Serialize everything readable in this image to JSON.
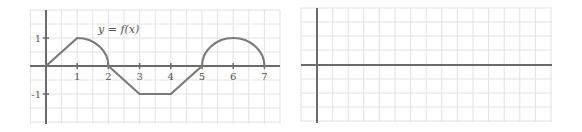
{
  "left_graph": {
    "label": "y = f(x)",
    "x_ticks": [
      "1",
      "2",
      "3",
      "4",
      "5",
      "6",
      "7"
    ],
    "y_ticks": [
      "1",
      "-1"
    ],
    "colors": {
      "axis": "#6b6b6b",
      "curve": "#7a7a7a",
      "grid": "#e2e2e2"
    },
    "pieces": [
      {
        "type": "segment",
        "from": [
          0,
          0
        ],
        "to": [
          1,
          1
        ]
      },
      {
        "type": "quarter-circle",
        "center": [
          1,
          0
        ],
        "radius": 1,
        "from": [
          1,
          1
        ],
        "to": [
          2,
          0
        ]
      },
      {
        "type": "segment",
        "from": [
          2,
          0
        ],
        "to": [
          3,
          -1
        ]
      },
      {
        "type": "segment",
        "from": [
          3,
          -1
        ],
        "to": [
          4,
          -1
        ]
      },
      {
        "type": "segment",
        "from": [
          4,
          -1
        ],
        "to": [
          5,
          0
        ]
      },
      {
        "type": "semicircle",
        "center": [
          6,
          0
        ],
        "radius": 1,
        "from": [
          5,
          0
        ],
        "to": [
          7,
          0
        ]
      }
    ]
  },
  "right_graph": {
    "description": "blank grid with axes",
    "colors": {
      "axis": "#6b6b6b",
      "grid": "#e2e2e2"
    }
  }
}
